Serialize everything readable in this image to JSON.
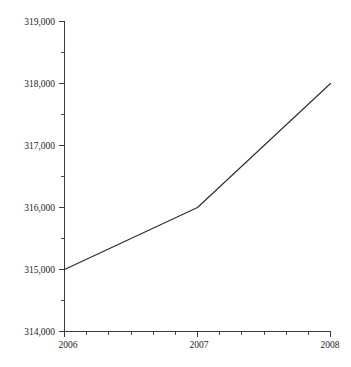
{
  "chart_data": {
    "type": "line",
    "title": "",
    "subtitle": "",
    "xlabel": "",
    "ylabel": "",
    "x": [
      2006,
      2007,
      2008
    ],
    "categories": [
      "2006",
      "2007",
      "2008"
    ],
    "values": [
      315000,
      316000,
      318000
    ],
    "series": [
      {
        "name": "",
        "values": [
          315000,
          316000,
          318000
        ]
      }
    ],
    "xlim": [
      2006,
      2008
    ],
    "ylim": [
      314000,
      319000
    ],
    "grid": false,
    "legend": false,
    "legend_position": "none",
    "y_ticks": [
      314000,
      315000,
      316000,
      317000,
      318000,
      319000
    ],
    "y_tick_labels": [
      "314,000",
      "315,000",
      "316,000",
      "317,000",
      "318,000",
      "319,000"
    ],
    "y_minor_tick_values": [
      314500,
      315500,
      316500,
      317500,
      318500
    ],
    "x_ticks": [
      2006,
      2007,
      2008
    ],
    "x_tick_labels": [
      "2006",
      "2007",
      "2008"
    ],
    "x_minor_tick_count_per_interval": 5,
    "annotations": []
  },
  "style": {
    "line_color": "#2b2b2b",
    "axis_color": "#3a3a3a",
    "text_color": "#1c1c1c",
    "background_color": "#ffffff"
  },
  "axes": {
    "y_axis_name": "value-axis",
    "x_axis_name": "year-axis"
  }
}
